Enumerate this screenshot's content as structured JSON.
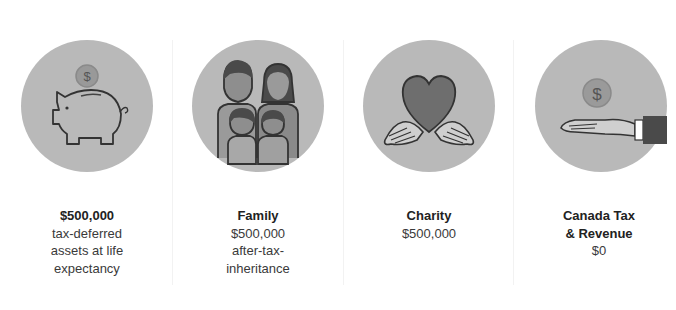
{
  "items": [
    {
      "title": "$500,000",
      "lines": [
        "tax-deferred",
        "assets at life",
        "expectancy"
      ],
      "icon": "piggy-bank-coin-icon"
    },
    {
      "title": "Family",
      "lines": [
        "$500,000",
        "after-tax-",
        "inheritance"
      ],
      "icon": "family-icon"
    },
    {
      "title": "Charity",
      "lines": [
        "$500,000"
      ],
      "icon": "heart-hands-icon"
    },
    {
      "title_lines": [
        "Canada Tax",
        "& Revenue"
      ],
      "lines": [
        "$0"
      ],
      "icon": "hand-coin-icon"
    }
  ],
  "colors": {
    "circle": "#b9b9b9",
    "icon_dark": "#555555",
    "icon_mid": "#8c8c8c",
    "text": "#3a3a3a"
  }
}
